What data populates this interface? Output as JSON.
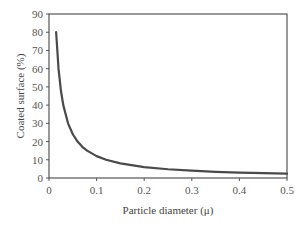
{
  "chart_data": {
    "type": "line",
    "title": "",
    "xlabel": "Particle diameter (μ)",
    "ylabel": "Coated surface (%)",
    "xlim": [
      0,
      0.5
    ],
    "ylim": [
      0,
      90
    ],
    "xticks": [
      0,
      0.1,
      0.2,
      0.3,
      0.4,
      0.5
    ],
    "xtick_labels": [
      "0",
      "0.1",
      "0.2",
      "0.3",
      "0.4",
      "0.5"
    ],
    "yticks": [
      0,
      10,
      20,
      30,
      40,
      50,
      60,
      70,
      80,
      90
    ],
    "ytick_labels": [
      "0",
      "10",
      "20",
      "30",
      "40",
      "50",
      "60",
      "70",
      "80",
      "90"
    ],
    "grid": false,
    "legend": null,
    "series": [
      {
        "name": "Coated surface",
        "color": "#4a4a4a",
        "x": [
          0.015,
          0.02,
          0.025,
          0.03,
          0.04,
          0.05,
          0.06,
          0.07,
          0.08,
          0.1,
          0.12,
          0.15,
          0.2,
          0.25,
          0.3,
          0.35,
          0.4,
          0.45,
          0.5
        ],
        "y": [
          80,
          60,
          48,
          40,
          30,
          24,
          20,
          17.1,
          15,
          12,
          10,
          8,
          6,
          4.8,
          4,
          3.4,
          3,
          2.7,
          2.4
        ]
      }
    ]
  },
  "colors": {
    "axis": "#555555",
    "line": "#4a4a4a"
  }
}
